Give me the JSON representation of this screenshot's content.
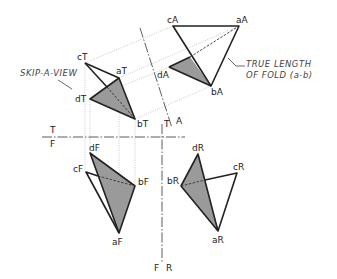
{
  "annotations": {
    "skip_a_view": "SKIP-A-VIEW",
    "true_length_line1": "TRUE LENGTH",
    "true_length_line2": "OF FOLD (a-b)"
  },
  "fold_labels": {
    "top_over_front_T": "T",
    "top_over_front_F": "F",
    "top_aux_T": "T",
    "top_aux_A": "A",
    "front_right_F": "F",
    "front_right_R": "R"
  },
  "views": {
    "top": {
      "a": "aT",
      "b": "bT",
      "c": "cT",
      "d": "dT"
    },
    "auxiliary": {
      "a": "aA",
      "b": "bA",
      "c": "cA",
      "d": "dA"
    },
    "front": {
      "a": "aF",
      "b": "bF",
      "c": "cF",
      "d": "dF"
    },
    "right": {
      "a": "aR",
      "b": "bR",
      "c": "cR",
      "d": "dR"
    }
  }
}
